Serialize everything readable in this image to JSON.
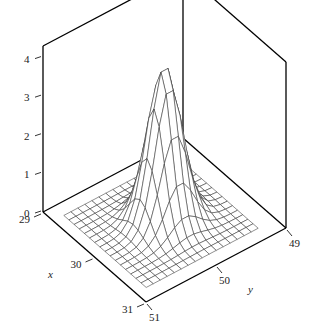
{
  "chart_data": {
    "type": "surface3d",
    "title": "",
    "xlabel": "x",
    "ylabel": "y",
    "zlabel": "",
    "x_ticks": [
      29,
      30,
      31
    ],
    "y_ticks": [
      49,
      50,
      51
    ],
    "z_ticks": [
      0,
      1,
      2,
      3,
      4
    ],
    "x_range": [
      29,
      31
    ],
    "y_range": [
      49,
      51
    ],
    "z_range": [
      0,
      4.3
    ],
    "grid": false,
    "box": true,
    "surface": {
      "description": "Bivariate Gaussian-like density peak (wireframe mesh)",
      "x_grid": [
        29.2,
        29.3,
        29.4,
        29.5,
        29.6,
        29.7,
        29.8,
        29.9,
        30.0,
        30.1,
        30.2,
        30.3,
        30.4,
        30.5,
        30.6,
        30.7,
        30.8
      ],
      "y_grid": [
        49.25,
        49.35,
        49.45,
        49.55,
        49.65,
        49.75,
        49.85,
        49.95,
        50.05,
        50.15,
        50.25,
        50.35,
        50.45,
        50.55,
        50.65,
        50.75,
        50.85
      ],
      "peak_height": 4.0,
      "peak_center": [
        30.0,
        50.0
      ],
      "sigma_x": 0.2,
      "sigma_y": 0.2
    }
  },
  "labels": {
    "x_axis": "x",
    "y_axis": "y",
    "x_ticks": [
      "29",
      "30",
      "31"
    ],
    "y_ticks": [
      "49",
      "50",
      "51"
    ],
    "z_ticks": [
      "0",
      "1",
      "2",
      "3",
      "4"
    ]
  }
}
